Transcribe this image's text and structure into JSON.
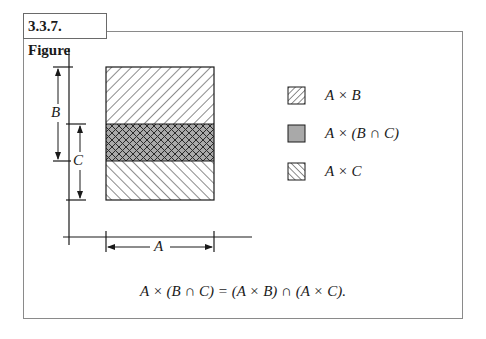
{
  "header": {
    "title": "3.3.7. Figure"
  },
  "diagram": {
    "axis_labels": {
      "horizontal": "A",
      "vertical_top": "B",
      "vertical_bottom": "C"
    },
    "regions": [
      {
        "name": "A × B only",
        "pattern": "diagonal-backslash-hatch"
      },
      {
        "name": "A × (B ∩ C)",
        "pattern": "cross-hatch-gray"
      },
      {
        "name": "A × C only",
        "pattern": "diagonal-slash-hatch"
      }
    ],
    "colors": {
      "line": "#1a1a1a",
      "fill_gray": "#a9a9a9",
      "frame": "#8a8a8a"
    }
  },
  "legend": {
    "items": [
      {
        "icon": "backslash-hatch-swatch",
        "label": "A × B"
      },
      {
        "icon": "gray-swatch",
        "label": "A × (B ∩ C)"
      },
      {
        "icon": "slash-hatch-swatch",
        "label": "A × C"
      }
    ]
  },
  "caption": {
    "equation": "A × (B ∩ C) = (A × B) ∩ (A × C)."
  }
}
